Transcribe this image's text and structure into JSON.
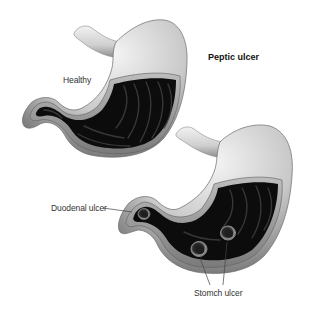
{
  "figure": {
    "title": "Peptic ulcer",
    "panels": [
      {
        "id": "healthy",
        "label": "Healthy"
      },
      {
        "id": "ulcer",
        "labels": {
          "duodenal": "Duodenal ulcer",
          "stomach": "Stomch ulcer"
        },
        "ulcer_count": {
          "duodenal": 1,
          "stomach": 2
        }
      }
    ]
  },
  "colors": {
    "background": "#ffffff",
    "wall_light": "#e8e8e8",
    "wall_mid": "#9a9a9a",
    "wall_dark": "#5a5a5a",
    "cavity": "#0c0c0c",
    "fold": "#3a3a3a",
    "label_text": "#333333"
  }
}
